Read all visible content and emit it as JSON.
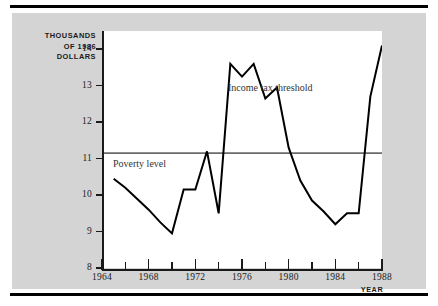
{
  "figure": {
    "background_color": "#d4d4d4",
    "plot_background_color": "#ffffff",
    "rule_color": "#000000"
  },
  "axis": {
    "y_title": "THOUSANDS\nOF 1986\nDOLLARS",
    "x_title": "YEAR",
    "y_ticks": [
      "8",
      "9",
      "10",
      "11",
      "12",
      "13",
      "14"
    ],
    "x_ticks": [
      "1964",
      "1966",
      "1968",
      "1970",
      "1972",
      "1974",
      "1976",
      "1978",
      "1980",
      "1982",
      "1984",
      "1986",
      "1988"
    ],
    "x_major_labels": [
      "1964",
      "1968",
      "1972",
      "1976",
      "1980",
      "1984",
      "1988"
    ]
  },
  "annotations": {
    "poverty_label": "Poverty level",
    "threshold_label": "Income tax threshold"
  },
  "chart_data": {
    "type": "line",
    "title": "",
    "subtitle": "",
    "xlabel": "YEAR",
    "ylabel": "THOUSANDS OF 1986 DOLLARS",
    "xlim": [
      1964,
      1988
    ],
    "ylim": [
      8,
      14.5
    ],
    "grid": false,
    "legend": "inline-annotations",
    "x_tick_labels": [
      "1964",
      "1968",
      "1972",
      "1976",
      "1980",
      "1984",
      "1988"
    ],
    "x_minor_tick_interval": 2,
    "y_tick_labels": [
      "8",
      "9",
      "10",
      "11",
      "12",
      "13",
      "14"
    ],
    "series": [
      {
        "name": "Income tax threshold",
        "color": "#000000",
        "line_width": 2,
        "x": [
          1965,
          1966,
          1967,
          1968,
          1969,
          1970,
          1971,
          1972,
          1973,
          1974,
          1975,
          1976,
          1977,
          1978,
          1979,
          1980,
          1981,
          1982,
          1983,
          1984,
          1985,
          1986,
          1987,
          1988
        ],
        "y": [
          10.45,
          10.2,
          9.9,
          9.6,
          9.25,
          8.95,
          10.15,
          10.15,
          11.2,
          9.5,
          13.6,
          13.25,
          13.6,
          12.65,
          12.95,
          11.3,
          10.4,
          9.85,
          9.55,
          9.2,
          9.5,
          9.5,
          12.7,
          14.1
        ]
      }
    ],
    "reference_lines": [
      {
        "name": "Poverty level",
        "orientation": "horizontal",
        "value": 11.15,
        "color": "#6b6b6b",
        "line_width": 1.6
      }
    ]
  }
}
